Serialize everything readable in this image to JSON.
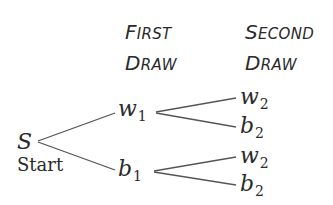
{
  "headers": {
    "first": {
      "line1_cap": "F",
      "line1_rest": "IRST",
      "line2_cap": "D",
      "line2_rest": "RAW"
    },
    "second": {
      "line1_cap": "S",
      "line1_rest": "ECOND",
      "line2_cap": "D",
      "line2_rest": "RAW"
    }
  },
  "root": {
    "symbol": "S",
    "label": "Start"
  },
  "first_draw": [
    {
      "letter": "w",
      "sub": "1"
    },
    {
      "letter": "b",
      "sub": "1"
    }
  ],
  "second_draw": [
    {
      "letter": "w",
      "sub": "2"
    },
    {
      "letter": "b",
      "sub": "2"
    },
    {
      "letter": "w",
      "sub": "2"
    },
    {
      "letter": "b",
      "sub": "2"
    }
  ],
  "colors": {
    "text": "#2a2a2a",
    "lines": "#555555",
    "background": "#ffffff"
  }
}
